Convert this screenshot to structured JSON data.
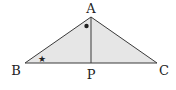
{
  "diagram": {
    "type": "geometry-triangle",
    "colors": {
      "fill": "#e6e6e6",
      "stroke": "#3a3a3a",
      "text": "#222222",
      "background": "#ffffff"
    },
    "points": {
      "A": {
        "label": "A",
        "x": 91,
        "y": 17
      },
      "B": {
        "label": "B",
        "x": 25,
        "y": 63
      },
      "C": {
        "label": "C",
        "x": 157,
        "y": 63
      },
      "P": {
        "label": "P",
        "x": 91,
        "y": 63
      }
    },
    "segments": [
      "AB",
      "AC",
      "BC",
      "AP"
    ],
    "angle_marks": {
      "angle_B": {
        "symbol": "★",
        "meaning": "star mark at angle B"
      },
      "angle_BAP": {
        "symbol": "●",
        "meaning": "dot mark at angle BAP"
      }
    }
  }
}
